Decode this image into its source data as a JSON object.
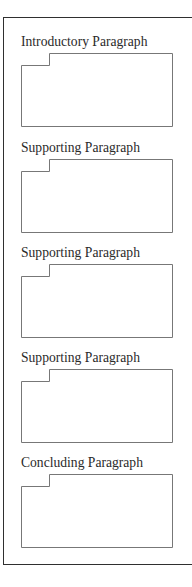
{
  "diagram": {
    "sections": [
      {
        "label": "Introductory Paragraph",
        "label_top": 35,
        "box_top": 53,
        "box_bottom": 126
      },
      {
        "label": "Supporting Paragraph",
        "label_top": 141,
        "box_top": 159,
        "box_bottom": 232
      },
      {
        "label": "Supporting Paragraph",
        "label_top": 246,
        "box_top": 264,
        "box_bottom": 337
      },
      {
        "label": "Supporting Paragraph",
        "label_top": 351,
        "box_top": 369,
        "box_bottom": 442
      },
      {
        "label": "Concluding Paragraph",
        "label_top": 456,
        "box_top": 474,
        "box_bottom": 547
      }
    ],
    "colors": {
      "outer_border": "#2f2f2f",
      "box_border": "#777777",
      "text": "#2a2a2a"
    }
  }
}
